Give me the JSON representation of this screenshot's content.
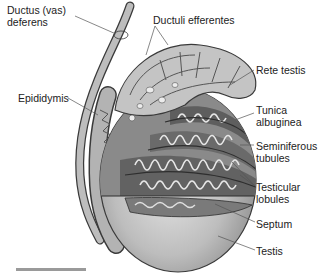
{
  "figure": {
    "labels": {
      "ductus_deferens": "Ductus (vas)\ndeferens",
      "ductuli_efferentes": "Ductuli efferentes",
      "epididymis": "Epididymis",
      "rete_testis": "Rete testis",
      "tunica_albuginea": "Tunica\nalbuginea",
      "seminiferous_tubules": "Seminiferous\ntubules",
      "testicular_lobules": "Testicular\nlobules",
      "septum": "Septum",
      "testis": "Testis"
    },
    "colors": {
      "outline": "#3a3a3a",
      "tissue_light": "#c9c9c9",
      "tissue_mid": "#a8a8a8",
      "tissue_dark": "#6e6e6e",
      "testis_shade": "#b5b5b5",
      "background": "#ffffff"
    }
  }
}
